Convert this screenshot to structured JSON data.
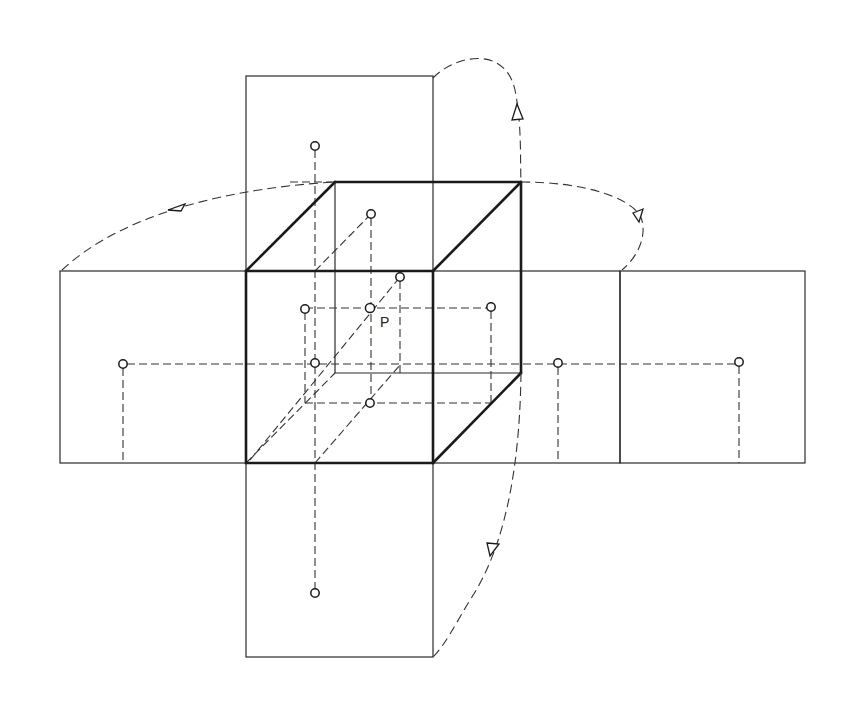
{
  "diagram": {
    "point_label": "P",
    "panels": [
      {
        "name": "top-panel",
        "x": 246,
        "y": 76,
        "w": 187,
        "h": 195
      },
      {
        "name": "left-panel",
        "x": 60,
        "y": 271,
        "w": 186,
        "h": 192
      },
      {
        "name": "right-panel-1",
        "x": 433,
        "y": 271,
        "w": 187,
        "h": 192
      },
      {
        "name": "right-panel-2",
        "x": 620,
        "y": 271,
        "w": 185,
        "h": 192
      },
      {
        "name": "bottom-panel",
        "x": 246,
        "y": 463,
        "w": 187,
        "h": 194
      }
    ],
    "cube": {
      "front": [
        [
          246,
          271
        ],
        [
          433,
          271
        ],
        [
          433,
          463
        ],
        [
          246,
          463
        ]
      ],
      "back": [
        [
          335,
          182
        ],
        [
          521,
          182
        ],
        [
          521,
          373
        ],
        [
          335,
          373
        ]
      ]
    },
    "points": [
      {
        "name": "point-P",
        "x": 370,
        "y": 308
      },
      {
        "name": "projection-top-panel",
        "x": 315,
        "y": 146
      },
      {
        "name": "projection-cube-top",
        "x": 371,
        "y": 214
      },
      {
        "name": "projection-cube-top-front",
        "x": 400,
        "y": 277
      },
      {
        "name": "projection-cube-left-upper",
        "x": 305,
        "y": 309
      },
      {
        "name": "projection-cube-right",
        "x": 491,
        "y": 307
      },
      {
        "name": "projection-cube-left",
        "x": 315,
        "y": 363
      },
      {
        "name": "projection-cube-bottom",
        "x": 370,
        "y": 403
      },
      {
        "name": "projection-left-panel",
        "x": 123,
        "y": 364
      },
      {
        "name": "projection-right-panel-1",
        "x": 558,
        "y": 363
      },
      {
        "name": "projection-right-panel-2",
        "x": 739,
        "y": 362
      },
      {
        "name": "projection-bottom-panel",
        "x": 315,
        "y": 593
      }
    ],
    "colors": {
      "line": "#1a1a1a",
      "background": "#ffffff"
    }
  }
}
